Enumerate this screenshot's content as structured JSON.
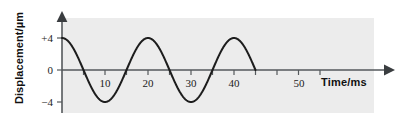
{
  "figure": {
    "background_color": "#ffffff",
    "panel_color": "#ececec",
    "curve_color": "#1d1d1d",
    "axis_color": "#55595c"
  },
  "axes": {
    "x_axis_label": "Time/ms",
    "y_axis_label": "Displacement/µm",
    "x_tick_labels": [
      "10",
      "20",
      "30",
      "40",
      "50"
    ],
    "y_tick_labels": [
      "+4",
      "0",
      "−4"
    ]
  },
  "chart_data": {
    "type": "line",
    "title": "",
    "xlabel": "Time/ms",
    "ylabel": "Displacement/µm",
    "xlim": [
      0,
      57
    ],
    "ylim": [
      -5.2,
      5.2
    ],
    "xticks": [
      10,
      20,
      30,
      40,
      50
    ],
    "xticklabels": [
      "10",
      "20",
      "30",
      "40",
      "50"
    ],
    "x_minor_ticks": [
      5,
      15,
      25,
      35,
      45,
      55
    ],
    "yticks": [
      4,
      0,
      -4
    ],
    "yticklabels": [
      "+4",
      "0",
      "−4"
    ],
    "grid": false,
    "legend": null,
    "waveform": {
      "form": "cosine",
      "amplitude": 4,
      "amplitude_units": "µm",
      "period": 20,
      "period_units": "ms",
      "frequency_hz": 50,
      "phase_deg": 0,
      "t_start": 0,
      "t_end": 45,
      "equation": "y = 4 cos(2πt/20)"
    },
    "series": [
      {
        "name": "displacement",
        "x": [
          0,
          2.5,
          5,
          7.5,
          10,
          12.5,
          15,
          17.5,
          20,
          22.5,
          25,
          27.5,
          30,
          32.5,
          35,
          37.5,
          40,
          42.5,
          45
        ],
        "y": [
          4,
          2.83,
          0,
          -2.83,
          -4,
          -2.83,
          0,
          2.83,
          4,
          2.83,
          0,
          -2.83,
          -4,
          -2.83,
          0,
          2.83,
          4,
          2.83,
          0
        ]
      }
    ],
    "annotations": [
      {
        "label": "maximum displacement",
        "value": 4,
        "unit": "µm"
      },
      {
        "label": "minimum displacement",
        "value": -4,
        "unit": "µm"
      }
    ]
  }
}
